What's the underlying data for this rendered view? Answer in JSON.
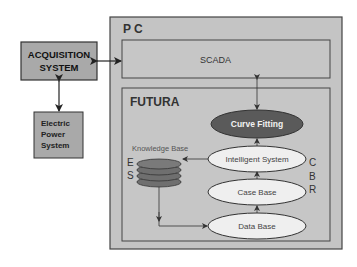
{
  "diagram": {
    "acquisition": {
      "line1": "ACQUISITION",
      "line2": "SYSTEM"
    },
    "electric": {
      "line1": "Electric",
      "line2": "Power",
      "line3": "System"
    },
    "pc": {
      "title": "P C"
    },
    "scada": {
      "label": "SCADA"
    },
    "futura": {
      "title": "FUTURA"
    },
    "knowledge_base": {
      "label": "Knowledge Base"
    },
    "es": {
      "e": "E",
      "s": "S"
    },
    "cbr": {
      "c": "C",
      "b": "B",
      "r": "R"
    },
    "nodes": {
      "curve_fitting": "Curve Fitting",
      "intelligent_system": "Intelligent System",
      "case_base": "Case Base",
      "data_base": "Data Base"
    },
    "colors": {
      "box_fill": "#a9a9a9",
      "pc_fill": "#c4c4c4",
      "dark_ellipse": "#5a5a5a",
      "light_ellipse": "#efefef",
      "db_disk": "#6f6f6f"
    }
  }
}
